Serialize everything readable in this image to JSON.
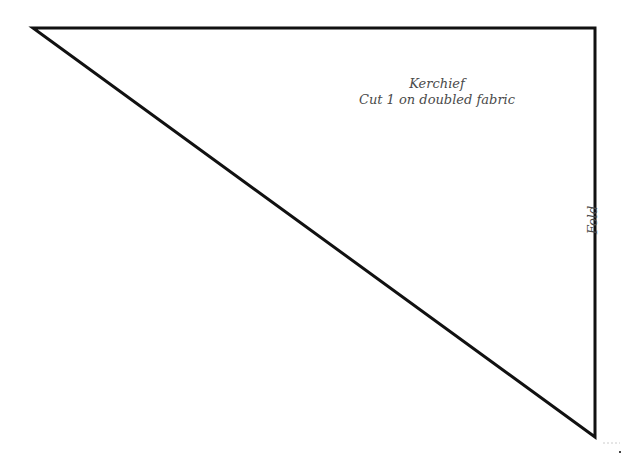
{
  "pattern_piece": {
    "name": "Kerchief",
    "instruction": "Cut 1 on doubled fabric",
    "fold_label": "Fold",
    "shape": "right-triangle",
    "vertices": [
      [
        33,
        28
      ],
      [
        595,
        28
      ],
      [
        595,
        437
      ]
    ],
    "stroke_color": "#111111",
    "text_color": "#4a4a4a"
  }
}
